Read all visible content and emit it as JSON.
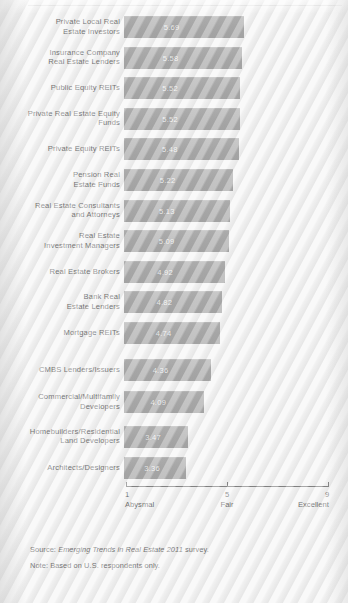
{
  "chart_data": {
    "type": "bar",
    "orientation": "horizontal",
    "title": "",
    "subtitle": "",
    "xlabel": "",
    "ylabel": "",
    "xlim": [
      1,
      9
    ],
    "grid": false,
    "legend": null,
    "categories": [
      "Private Local Real\nEstate Investors",
      "Insurance Company\nReal Estate Lenders",
      "Public Equity REITs",
      "Private Real Estate Equity\nFunds",
      "Private Equity REITs",
      "Pension Real\nEstate Funds",
      "Real Estate Consultants\nand Attorneys",
      "Real Estate\nInvestment Managers",
      "Real Estate Brokers",
      "Bank Real\nEstate Lenders",
      "Mortgage REITs",
      "CMBS Lenders/Issuers",
      "Commercial/Multifamily\nDevelopers",
      "Homebuilders/Residential\nLand Developers",
      "Architects/Designers"
    ],
    "values": [
      5.69,
      5.58,
      5.52,
      5.52,
      5.48,
      5.22,
      5.13,
      5.09,
      4.92,
      4.82,
      4.74,
      4.36,
      4.09,
      3.47,
      3.36
    ],
    "value_labels": [
      "5.69",
      "5.58",
      "5.52",
      "5.52",
      "5.48",
      "5.22",
      "5.13",
      "5.09",
      "4.92",
      "4.82",
      "4.74",
      "4.36",
      "4.09",
      "3.47",
      "3.36"
    ],
    "axis": {
      "ticks": [
        1,
        5,
        9
      ],
      "tick_labels": [
        "1",
        "5",
        "9"
      ],
      "tick_sublabels": [
        "Abysmal",
        "Fair",
        "Excellent"
      ]
    },
    "bar_color": "#868686",
    "value_label_color": "#f2f2f2",
    "background_color": "#f3f3f3"
  },
  "footnotes": {
    "source_prefix": "Source: ",
    "source_italic": "Emerging Trends in Real Estate 2011",
    "source_suffix": " survey.",
    "note": "Note: Based on U.S. respondents only."
  }
}
